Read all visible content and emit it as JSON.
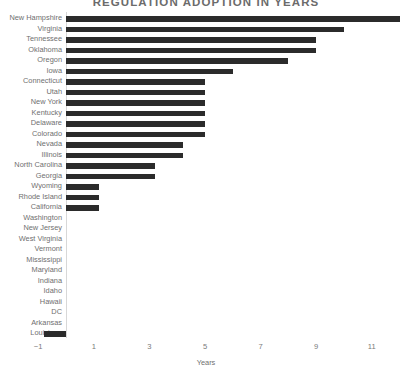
{
  "chart_data": {
    "type": "bar",
    "orientation": "horizontal",
    "title": "REGULATION ADOPTION IN YEARS",
    "xlabel": "Years",
    "ylabel": "",
    "xlim": [
      -1.6,
      12.6
    ],
    "xticks": [
      -1,
      1,
      3,
      5,
      7,
      9,
      11
    ],
    "xtick_labels": [
      "−1",
      "1",
      "3",
      "5",
      "7",
      "9",
      "11"
    ],
    "grid": false,
    "legend": null,
    "bar_color": "#2b2b2b",
    "categories": [
      "New Hampshire",
      "Virginia",
      "Tennessee",
      "Oklahoma",
      "Oregon",
      "Iowa",
      "Connecticut",
      "Utah",
      "New York",
      "Kentucky",
      "Delaware",
      "Colorado",
      "Nevada",
      "Illinois",
      "North Carolina",
      "Georgia",
      "Wyoming",
      "Rhode Island",
      "California",
      "Washington",
      "New Jersey",
      "West Virginia",
      "Vermont",
      "Mississippi",
      "Maryland",
      "Indiana",
      "Idaho",
      "Hawaii",
      "DC",
      "Arkansas",
      "Louisiana"
    ],
    "values": [
      12,
      10,
      9,
      9,
      8,
      6,
      5,
      5,
      5,
      5,
      5,
      5,
      4.2,
      4.2,
      3.2,
      3.2,
      1.2,
      1.2,
      1.2,
      0,
      0,
      0,
      0,
      0,
      0,
      0,
      0,
      0,
      0,
      0,
      -0.8
    ]
  }
}
